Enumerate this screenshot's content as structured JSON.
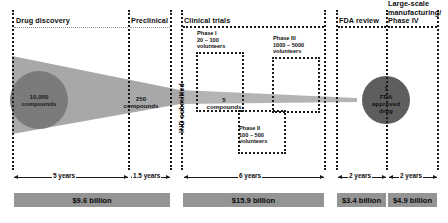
{
  "diagram": {
    "sections": [
      {
        "id": "drug-discovery",
        "label": "Drug discovery"
      },
      {
        "id": "preclinical",
        "label": "Preclinical"
      },
      {
        "id": "clinical-trials",
        "label": "Clinical trials"
      },
      {
        "id": "fda-review",
        "label": "FDA review"
      },
      {
        "id": "phase-iv",
        "label_line1": "Large-scale",
        "label_line2": "manufacturing/",
        "label_line3": "Phase IV"
      }
    ],
    "gate": {
      "label": "IND submitted"
    },
    "funnel_stages": [
      {
        "id": "start",
        "count": "10,000",
        "unit": "compounds"
      },
      {
        "id": "preclin",
        "count": "250",
        "unit": "compounds"
      },
      {
        "id": "clinical",
        "count": "5",
        "unit": "compounds"
      },
      {
        "id": "approved",
        "count": "1",
        "unit_line1": "FDA",
        "unit_line2": "approved",
        "unit_line3": "drug"
      }
    ],
    "phase_boxes": [
      {
        "id": "phase-1",
        "name": "Phase I",
        "volunteers": "20 – 100",
        "unit": "volunteers"
      },
      {
        "id": "phase-3",
        "name": "Phase III",
        "volunteers": "1000 – 5000",
        "unit": "volunteers"
      },
      {
        "id": "phase-2",
        "name": "Phase II",
        "volunteers": "100 – 500",
        "unit": "volunteers"
      }
    ],
    "timeline": [
      {
        "id": "t-discovery",
        "label": "5 years"
      },
      {
        "id": "t-preclinical",
        "label": "1.5 years"
      },
      {
        "id": "t-clinical",
        "label": "6 years"
      },
      {
        "id": "t-fda",
        "label": "2 years"
      },
      {
        "id": "t-phase4",
        "label": "2 years"
      }
    ],
    "costs": [
      {
        "id": "c-discovery-preclinical",
        "label": "$9.6 billion"
      },
      {
        "id": "c-clinical",
        "label": "$15.9 billion"
      },
      {
        "id": "c-fda",
        "label": "$3.4 billion"
      },
      {
        "id": "c-phase4",
        "label": "$4.9 billion"
      }
    ],
    "colors": {
      "funnel": "#a8a8a8",
      "circle_start": "#7b7b7b",
      "circle_end": "#5e5e5e",
      "cost_bar": "#949494",
      "ink": "#1a1a1a"
    }
  }
}
